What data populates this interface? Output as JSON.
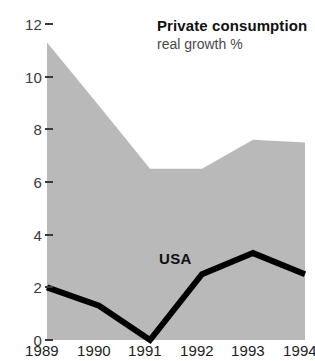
{
  "chart_data": {
    "type": "area",
    "title": "Private consumption",
    "subtitle": "real growth %",
    "xlabel": "",
    "ylabel": "",
    "ylim": [
      0,
      12
    ],
    "y_ticks": [
      0,
      2,
      4,
      6,
      8,
      10,
      12
    ],
    "y_tick_labels": [
      "0",
      "2",
      "4",
      "6",
      "8",
      "10",
      "12"
    ],
    "grid": false,
    "legend_position": "inline-annotation",
    "categories": [
      "1989",
      "1990",
      "1991",
      "1992",
      "1993",
      "1994"
    ],
    "x": [
      1989,
      1990,
      1991,
      1992,
      1993,
      1994
    ],
    "x_tick_labels": [
      "1989",
      "1990",
      "1991",
      "1992",
      "1993",
      "1994"
    ],
    "series": [
      {
        "name": "range-band-upper",
        "kind": "area",
        "color": "#b9b9b9",
        "values": [
          11.3,
          8.9,
          6.5,
          6.5,
          7.6,
          7.5
        ]
      },
      {
        "name": "range-band-lower",
        "kind": "area",
        "color": "#b9b9b9",
        "values": [
          0,
          0,
          0,
          0,
          0,
          0
        ]
      },
      {
        "name": "USA",
        "kind": "line",
        "color": "#000000",
        "values": [
          2.0,
          1.3,
          0.0,
          2.5,
          3.3,
          2.5
        ]
      }
    ],
    "annotations": [
      {
        "text": "USA",
        "x": 1992,
        "y": 2.9
      }
    ]
  },
  "axes": {
    "y_ticks": [
      {
        "label": "12",
        "value": 12
      },
      {
        "label": "10",
        "value": 10
      },
      {
        "label": "8",
        "value": 8
      },
      {
        "label": "6",
        "value": 6
      },
      {
        "label": "4",
        "value": 4
      },
      {
        "label": "2",
        "value": 2
      },
      {
        "label": "0",
        "value": 0
      }
    ],
    "x_ticks": [
      {
        "label": "1989"
      },
      {
        "label": "1990"
      },
      {
        "label": "1991"
      },
      {
        "label": "1992"
      },
      {
        "label": "1993"
      },
      {
        "label": "1994"
      }
    ]
  },
  "labels": {
    "title": "Private consumption",
    "subtitle": "real growth %",
    "series_usa": "USA"
  },
  "colors": {
    "band": "#b9b9b9",
    "line": "#000000",
    "tick_text": "#3a3a3a",
    "title_text": "#111111",
    "subtitle_text": "#4a4a4a",
    "background": "#ffffff"
  }
}
